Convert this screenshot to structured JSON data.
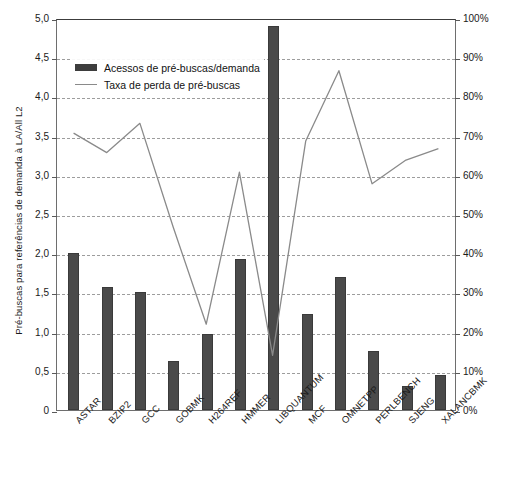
{
  "chart_data": {
    "type": "bar",
    "title": "",
    "subtitle": "",
    "categories": [
      "ASTAR",
      "BZIP2",
      "GCC",
      "GOBMK",
      "H264REF",
      "HMMER",
      "LIBQUANTUM",
      "MCF",
      "OMNETPP",
      "PERLBENCH",
      "SJENG",
      "XALANCBMK"
    ],
    "xlabel": "",
    "ylabel": "Pré-buscas para referências de demanda à LA/All L2",
    "ylabel_secondary": "Prefetch miss rate",
    "ylim": [
      0,
      5.0
    ],
    "ylim_secondary": [
      0,
      1.0
    ],
    "yticks": [
      0,
      0.5,
      1.0,
      1.5,
      2.0,
      2.5,
      3.0,
      3.5,
      4.0,
      4.5,
      5.0
    ],
    "yticklabels": [
      "0",
      "0,5",
      "1,0",
      "1,5",
      "2,0",
      "2,5",
      "3,0",
      "3,5",
      "4,0",
      "4,5",
      "5,0"
    ],
    "yticks_secondary": [
      0,
      0.1,
      0.2,
      0.3,
      0.4,
      0.5,
      0.6,
      0.7,
      0.8,
      0.9,
      1.0
    ],
    "yticklabels_secondary": [
      "0%",
      "10%",
      "20%",
      "30%",
      "40%",
      "50%",
      "60%",
      "70%",
      "80%",
      "90%",
      "100%"
    ],
    "grid": true,
    "grid_style": "dashed",
    "legend_position": "upper-left",
    "bar_color": "#4a4a4a",
    "line_color": "#8a8a8a",
    "series": [
      {
        "name": "Acessos de pré-buscas/demanda",
        "kind": "bar",
        "axis": "left",
        "values": [
          2.0,
          1.57,
          1.5,
          0.63,
          0.97,
          1.92,
          4.9,
          1.23,
          1.7,
          0.75,
          0.3,
          0.45
        ]
      },
      {
        "name": "Taxa de perda de pré-buscas",
        "kind": "line",
        "axis": "right",
        "values": [
          0.71,
          0.66,
          0.735,
          0.47,
          0.22,
          0.61,
          0.14,
          0.69,
          0.87,
          0.58,
          0.64,
          0.67
        ]
      }
    ]
  },
  "legend": {
    "items": [
      {
        "label": "Acessos de pré-buscas/demanda",
        "marker": "bar-swatch"
      },
      {
        "label": "Taxa de perda de pré-buscas",
        "marker": "line-swatch"
      }
    ]
  },
  "caption": {
    "text": ""
  }
}
